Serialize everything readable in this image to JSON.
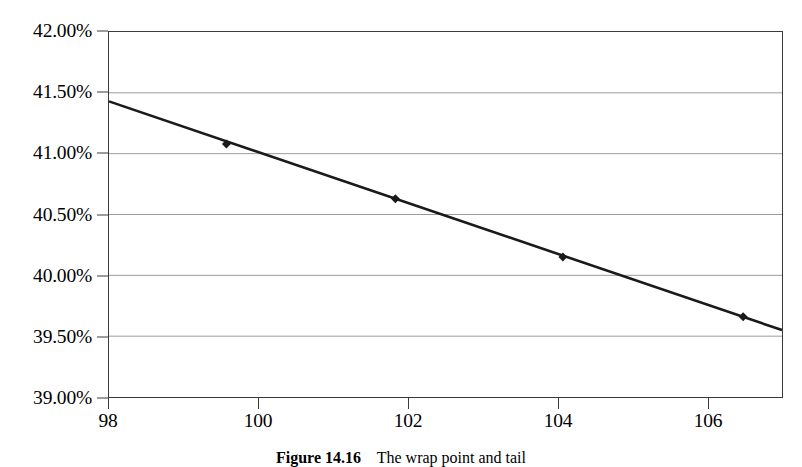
{
  "figure": {
    "caption_number": "Figure 14.16",
    "caption_text": "The wrap point and tail",
    "caption_full": "Figure 14.16  The wrap point and tail"
  },
  "chart_data": {
    "type": "line",
    "title": "",
    "xlabel": "",
    "ylabel": "",
    "xlim": [
      98,
      107
    ],
    "ylim": [
      39.0,
      42.0
    ],
    "ytick_format": "percent",
    "xticks": [
      98,
      100,
      102,
      104,
      106
    ],
    "xtick_labels": [
      "98",
      "100",
      "102",
      "104",
      "106"
    ],
    "yticks": [
      39.0,
      39.5,
      40.0,
      40.5,
      41.0,
      41.5,
      42.0
    ],
    "ytick_labels": [
      "39.00%",
      "39.50%",
      "40.00%",
      "40.50%",
      "41.00%",
      "41.50%",
      "42.00%"
    ],
    "grid": {
      "horizontal": true,
      "vertical": false,
      "color": "#9a9a9a"
    },
    "legend": {
      "visible": false,
      "position": "none"
    },
    "series": [
      {
        "name": "series-1",
        "color": "#1a1a1a",
        "line_width": 2.6,
        "marker": "diamond",
        "marker_size": 9,
        "line_endpoints": [
          {
            "x": 98.0,
            "y": 41.43
          },
          {
            "x": 107.0,
            "y": 39.55
          }
        ],
        "points": [
          {
            "x": 99.57,
            "y": 41.08
          },
          {
            "x": 101.83,
            "y": 40.63
          },
          {
            "x": 104.07,
            "y": 40.15
          },
          {
            "x": 106.48,
            "y": 39.66
          }
        ]
      }
    ]
  },
  "colors": {
    "frame": "#3a3a3a",
    "grid": "#9a9a9a",
    "line": "#1a1a1a",
    "background": "#ffffff",
    "text": "#000000"
  }
}
